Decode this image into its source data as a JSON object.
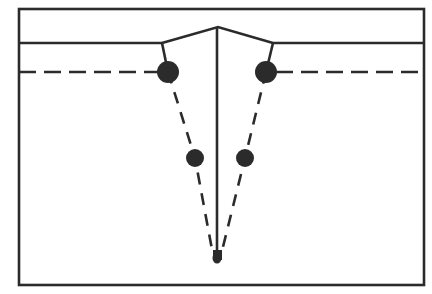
{
  "figure": {
    "background_color": "#ffffff",
    "ink_color": "#2b2b2b",
    "canvas": {
      "width": 432,
      "height": 294
    }
  },
  "frame": {
    "name": "outer-border-rectangle",
    "x": 19,
    "y": 9,
    "width": 405,
    "height": 276,
    "stroke_width": 2.6,
    "color": "#2b2b2b"
  },
  "surface": {
    "name": "specimen-surface-line",
    "y": 43,
    "left_start_x": 19,
    "left_end_x": 162,
    "right_start_x": 273,
    "right_end_x": 424,
    "stroke_width": 2.6,
    "color": "#2b2b2b"
  },
  "notch": {
    "name": "v-notch-flanks",
    "apex_x": 218,
    "apex_y": 27,
    "left_shoulder_x": 162,
    "left_shoulder_y": 43,
    "right_shoulder_x": 273,
    "right_shoulder_y": 43,
    "stroke_width": 2.6,
    "color": "#2b2b2b"
  },
  "centerline": {
    "name": "vertical-centerline",
    "x": 217,
    "top_y": 27,
    "bottom_y": 258,
    "stroke_width": 2.6,
    "color": "#2b2b2b"
  },
  "reference_line": {
    "name": "horizontal-dashed-reference-line",
    "y": 72,
    "left_start_x": 19,
    "left_end_x": 158,
    "right_start_x": 276,
    "right_end_x": 424,
    "stroke_width": 2.6,
    "dash": "17 8",
    "color": "#2b2b2b"
  },
  "shoulder_connectors": [
    {
      "name": "left-shoulder-connector",
      "x1": 162,
      "y1": 43,
      "x2": 168,
      "y2": 72,
      "stroke_width": 2.6
    },
    {
      "name": "right-shoulder-connector",
      "x1": 273,
      "y1": 43,
      "x2": 266,
      "y2": 72,
      "stroke_width": 2.6
    }
  ],
  "crack_paths": [
    {
      "name": "left-crack-path",
      "points": "168,72 195,158 213,255",
      "dash": "12 9",
      "stroke_width": 2.6
    },
    {
      "name": "right-crack-path",
      "points": "266,72 245,158 221,255",
      "dash": "12 9",
      "stroke_width": 2.6
    }
  ],
  "crack_tip": {
    "name": "crack-tip-blob",
    "x": 217,
    "y": 258,
    "width": 9,
    "height": 11,
    "color": "#2b2b2b"
  },
  "markers": [
    {
      "name": "marker-upper-left",
      "cx": 168,
      "cy": 72,
      "r": 11,
      "color": "#2b2b2b",
      "label": "upper left node"
    },
    {
      "name": "marker-upper-right",
      "cx": 266,
      "cy": 72,
      "r": 11,
      "color": "#2b2b2b",
      "label": "upper right node"
    },
    {
      "name": "marker-lower-left",
      "cx": 195,
      "cy": 158,
      "r": 9,
      "color": "#2b2b2b",
      "label": "lower left node"
    },
    {
      "name": "marker-lower-right",
      "cx": 245,
      "cy": 158,
      "r": 9,
      "color": "#2b2b2b",
      "label": "lower right node"
    }
  ]
}
